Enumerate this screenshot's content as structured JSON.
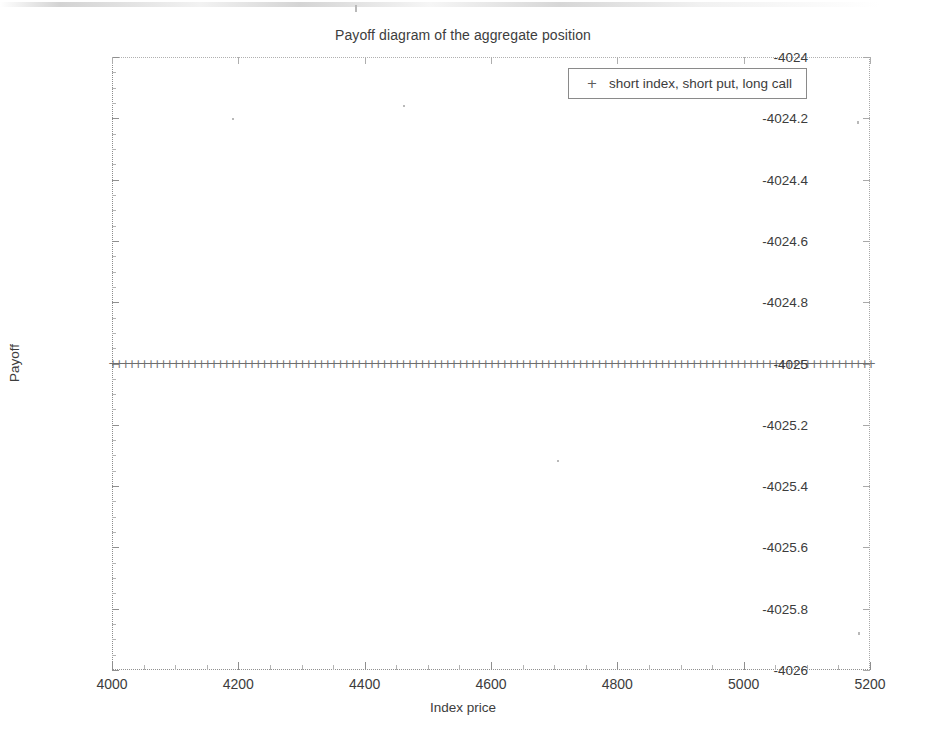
{
  "chart_data": {
    "type": "scatter",
    "title": "Payoff diagram of the aggregate position",
    "xlabel": "Index price",
    "ylabel": "Payoff",
    "xlim": [
      4000,
      5200
    ],
    "ylim": [
      -4026,
      -4024
    ],
    "grid": false,
    "legend_position": "top-right",
    "marker": "+",
    "series": [
      {
        "name": "short index, short put, long call",
        "marker": "+",
        "constant_value": -4025,
        "x": [
          4000,
          4010,
          4020,
          4030,
          4040,
          4050,
          4060,
          4070,
          4080,
          4090,
          4100,
          4110,
          4120,
          4130,
          4140,
          4150,
          4160,
          4170,
          4180,
          4190,
          4200,
          4210,
          4220,
          4230,
          4240,
          4250,
          4260,
          4270,
          4280,
          4290,
          4300,
          4310,
          4320,
          4330,
          4340,
          4350,
          4360,
          4370,
          4380,
          4390,
          4400,
          4410,
          4420,
          4430,
          4440,
          4450,
          4460,
          4470,
          4480,
          4490,
          4500,
          4510,
          4520,
          4530,
          4540,
          4550,
          4560,
          4570,
          4580,
          4590,
          4600,
          4610,
          4620,
          4630,
          4640,
          4650,
          4660,
          4670,
          4680,
          4690,
          4700,
          4710,
          4720,
          4730,
          4740,
          4750,
          4760,
          4770,
          4780,
          4790,
          4800,
          4810,
          4820,
          4830,
          4840,
          4850,
          4860,
          4870,
          4880,
          4890,
          4900,
          4910,
          4920,
          4930,
          4940,
          4950,
          4960,
          4970,
          4980,
          4990,
          5000,
          5010,
          5020,
          5030,
          5040,
          5050,
          5060,
          5070,
          5080,
          5090,
          5100,
          5110,
          5120,
          5130,
          5140,
          5150,
          5160,
          5170,
          5180,
          5190,
          5200
        ],
        "values": [
          -4025,
          -4025,
          -4025,
          -4025,
          -4025,
          -4025,
          -4025,
          -4025,
          -4025,
          -4025,
          -4025,
          -4025,
          -4025,
          -4025,
          -4025,
          -4025,
          -4025,
          -4025,
          -4025,
          -4025,
          -4025,
          -4025,
          -4025,
          -4025,
          -4025,
          -4025,
          -4025,
          -4025,
          -4025,
          -4025,
          -4025,
          -4025,
          -4025,
          -4025,
          -4025,
          -4025,
          -4025,
          -4025,
          -4025,
          -4025,
          -4025,
          -4025,
          -4025,
          -4025,
          -4025,
          -4025,
          -4025,
          -4025,
          -4025,
          -4025,
          -4025,
          -4025,
          -4025,
          -4025,
          -4025,
          -4025,
          -4025,
          -4025,
          -4025,
          -4025,
          -4025,
          -4025,
          -4025,
          -4025,
          -4025,
          -4025,
          -4025,
          -4025,
          -4025,
          -4025,
          -4025,
          -4025,
          -4025,
          -4025,
          -4025,
          -4025,
          -4025,
          -4025,
          -4025,
          -4025,
          -4025,
          -4025,
          -4025,
          -4025,
          -4025,
          -4025,
          -4025,
          -4025,
          -4025,
          -4025,
          -4025,
          -4025,
          -4025,
          -4025,
          -4025,
          -4025,
          -4025,
          -4025,
          -4025,
          -4025,
          -4025,
          -4025,
          -4025,
          -4025,
          -4025,
          -4025,
          -4025,
          -4025,
          -4025,
          -4025,
          -4025,
          -4025,
          -4025,
          -4025,
          -4025,
          -4025,
          -4025,
          -4025,
          -4025,
          -4025,
          -4025
        ]
      }
    ],
    "xticks": [
      4000,
      4200,
      4400,
      4600,
      4800,
      5000,
      5200
    ],
    "xticklabels": [
      "4000",
      "4200",
      "4400",
      "4600",
      "4800",
      "5000",
      "5200"
    ],
    "yticks": [
      -4024,
      -4024.2,
      -4024.4,
      -4024.6,
      -4024.8,
      -4025,
      -4025.2,
      -4025.4,
      -4025.6,
      -4025.8,
      -4026
    ],
    "yticklabels": [
      "-4024",
      "-4024.2",
      "-4024.4",
      "-4024.6",
      "-4024.8",
      "-4025",
      "-4025.2",
      "-4025.4",
      "-4025.6",
      "-4025.8",
      "-4026"
    ]
  },
  "legend": {
    "marker_glyph": "+",
    "entries": [
      {
        "label": "short index, short put, long call"
      }
    ]
  },
  "colors": {
    "background": "#ffffff",
    "axis": "#8f8f8f",
    "text": "#3c3c3c",
    "marker": "#6e6e6e"
  }
}
